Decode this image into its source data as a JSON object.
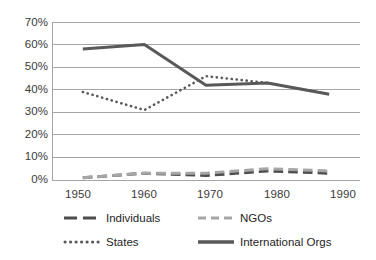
{
  "chart_data": {
    "type": "line",
    "title": "",
    "subtitle": "",
    "xlabel": "",
    "ylabel": "",
    "x": [
      1950,
      1960,
      1970,
      1980,
      1990
    ],
    "categories": [
      "1950",
      "1960",
      "1970",
      "1980",
      "1990"
    ],
    "xlim": [
      1945,
      1995
    ],
    "ylim": [
      0,
      70
    ],
    "y_tick_labels": [
      "70%",
      "60%",
      "50%",
      "40%",
      "30%",
      "20%",
      "10%",
      "0%"
    ],
    "y_tick_values": [
      70,
      60,
      50,
      40,
      30,
      20,
      10,
      0
    ],
    "grid": true,
    "legend_position": "bottom",
    "series": [
      {
        "name": "Individuals",
        "style": "dashed",
        "color": "#4d4d4d",
        "values": [
          1,
          3,
          2,
          4,
          3
        ]
      },
      {
        "name": "NGOs",
        "style": "dashed",
        "color": "#a6a6a6",
        "values": [
          1,
          3,
          3,
          5,
          4
        ]
      },
      {
        "name": "States",
        "style": "dotted",
        "color": "#595959",
        "values": [
          39,
          31,
          46,
          43,
          38
        ]
      },
      {
        "name": "International Orgs",
        "style": "solid",
        "color": "#595959",
        "values": [
          58,
          60,
          42,
          43,
          38
        ]
      }
    ]
  },
  "axes": {
    "y_labels": [
      {
        "text": "70%",
        "value": 70
      },
      {
        "text": "60%",
        "value": 60
      },
      {
        "text": "50%",
        "value": 50
      },
      {
        "text": "40%",
        "value": 40
      },
      {
        "text": "30%",
        "value": 30
      },
      {
        "text": "20%",
        "value": 20
      },
      {
        "text": "10%",
        "value": 10
      },
      {
        "text": "0%",
        "value": 0
      }
    ],
    "x_labels": [
      {
        "text": "1950",
        "value": 1950
      },
      {
        "text": "1960",
        "value": 1960
      },
      {
        "text": "1970",
        "value": 1970
      },
      {
        "text": "1980",
        "value": 1980
      },
      {
        "text": "1990",
        "value": 1990
      }
    ]
  },
  "legend": {
    "items": [
      {
        "label": "Individuals",
        "color": "#4d4d4d",
        "style": "dashed",
        "swatch": "dashed-line-swatch"
      },
      {
        "label": "NGOs",
        "color": "#a6a6a6",
        "style": "dashed",
        "swatch": "dashed-line-swatch"
      },
      {
        "label": "States",
        "color": "#595959",
        "style": "dotted",
        "swatch": "dotted-line-swatch"
      },
      {
        "label": "International Orgs",
        "color": "#595959",
        "style": "solid",
        "swatch": "solid-line-swatch"
      }
    ]
  },
  "colors": {
    "gridline": "#a6a6a6",
    "axis": "#a6a6a6",
    "background": "#ffffff",
    "text": "#262626"
  }
}
